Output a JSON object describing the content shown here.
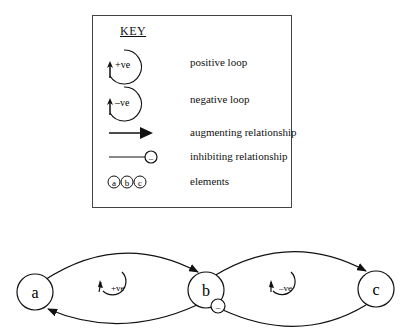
{
  "key": {
    "title": "KEY",
    "items": [
      {
        "symbol": "positive-loop",
        "symbol_text": "+ve",
        "label": "positive loop"
      },
      {
        "symbol": "negative-loop",
        "symbol_text": "–ve",
        "label": "negative loop"
      },
      {
        "symbol": "augmenting-arrow",
        "label": "augmenting relationship"
      },
      {
        "symbol": "inhibiting-line",
        "symbol_text": "–",
        "label": "inhibiting relationship"
      },
      {
        "symbol": "element-circles",
        "symbol_text": [
          "a",
          "b",
          "c"
        ],
        "label": "elements"
      }
    ]
  },
  "diagram": {
    "nodes": [
      {
        "id": "a",
        "label": "a"
      },
      {
        "id": "b",
        "label": "b"
      },
      {
        "id": "c",
        "label": "c"
      }
    ],
    "edges": [
      {
        "from": "a",
        "to": "b",
        "type": "augmenting"
      },
      {
        "from": "b",
        "to": "a",
        "type": "augmenting"
      },
      {
        "from": "b",
        "to": "c",
        "type": "augmenting"
      },
      {
        "from": "c",
        "to": "b",
        "type": "inhibiting",
        "symbol_text": "–"
      }
    ],
    "loops": [
      {
        "between": [
          "a",
          "b"
        ],
        "label": "+ve"
      },
      {
        "between": [
          "b",
          "c"
        ],
        "label": "–ve"
      }
    ]
  }
}
